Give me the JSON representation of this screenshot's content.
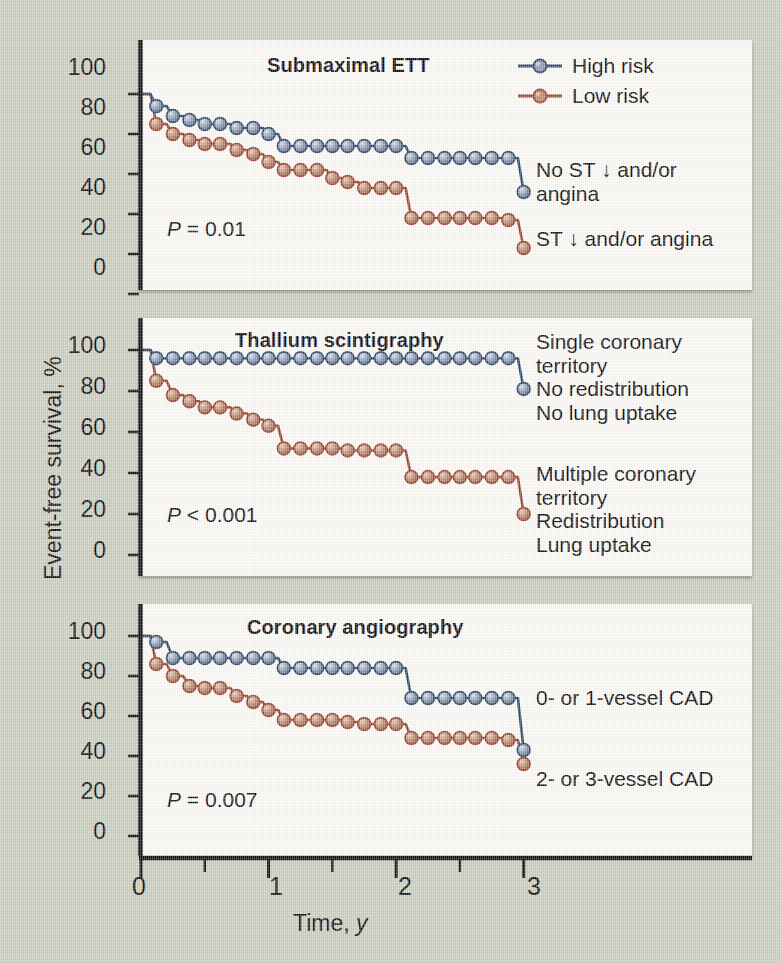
{
  "figure": {
    "background_color": "#ccd0bf",
    "panel_color": "#fdfcf7",
    "high_risk_color": "#2e4a6b",
    "low_risk_color": "#9c4430",
    "high_risk_marker_color": "#8c9cb4",
    "low_risk_marker_color": "#c08a6e",
    "x_axis_title_main": "Time, ",
    "x_axis_title_italic": "y",
    "y_axis_title": "Event-free survival, %",
    "x_tick_labels": [
      "0",
      "1",
      "2",
      "3"
    ],
    "y_tick_labels": [
      "0",
      "20",
      "40",
      "60",
      "80",
      "100"
    ]
  },
  "legend": {
    "items": [
      {
        "label": "High risk",
        "color": "#2e4a6b",
        "marker": "#8c9cb4"
      },
      {
        "label": "Low risk",
        "color": "#9c4430",
        "marker": "#c08a6e"
      }
    ]
  },
  "chart_data": [
    {
      "type": "line",
      "panel": "a",
      "title": "Submaximal ETT",
      "pvalue_prefix": "P",
      "pvalue_text": " = 0.01",
      "xlabel": "Time, y",
      "ylabel": "Event-free survival, %",
      "xlim": [
        0,
        3.12
      ],
      "ylim": [
        0,
        108
      ],
      "xticks": [
        0,
        1,
        2,
        3
      ],
      "yticks": [
        0,
        20,
        40,
        60,
        80,
        100
      ],
      "x_minor_ticks": [
        0.5,
        1.5,
        2.5
      ],
      "grid": false,
      "legend_position": "top-right",
      "label_high": "No ST ↓ and/or\nangina",
      "label_low": "ST ↓ and/or angina",
      "series": [
        {
          "name": "High risk",
          "color": "#2e4a6b",
          "marker_color": "#8c9cb4",
          "x": [
            0.0,
            0.12,
            0.25,
            0.38,
            0.5,
            0.62,
            0.75,
            0.88,
            1.0,
            1.12,
            1.25,
            1.38,
            1.5,
            1.62,
            1.75,
            1.88,
            2.0,
            2.12,
            2.25,
            2.38,
            2.5,
            2.62,
            2.75,
            2.88,
            3.0
          ],
          "y": [
            100,
            94,
            89,
            87,
            85,
            85,
            83,
            83,
            80,
            74,
            74,
            74,
            74,
            74,
            74,
            74,
            74,
            68,
            68,
            68,
            68,
            68,
            68,
            68,
            51
          ]
        },
        {
          "name": "Low risk",
          "color": "#9c4430",
          "marker_color": "#c08a6e",
          "x": [
            0.0,
            0.12,
            0.25,
            0.38,
            0.5,
            0.62,
            0.75,
            0.88,
            1.0,
            1.12,
            1.25,
            1.38,
            1.5,
            1.62,
            1.75,
            1.88,
            2.0,
            2.12,
            2.25,
            2.38,
            2.5,
            2.62,
            2.75,
            2.88,
            3.0
          ],
          "y": [
            100,
            85,
            80,
            77,
            75,
            75,
            72,
            70,
            66,
            62,
            62,
            62,
            58,
            56,
            53,
            53,
            53,
            38,
            38,
            38,
            38,
            38,
            38,
            37,
            23
          ]
        }
      ]
    },
    {
      "type": "line",
      "panel": "b",
      "title": "Thallium scintigraphy",
      "pvalue_prefix": "P",
      "pvalue_text": " < 0.001",
      "xlabel": "Time, y",
      "ylabel": "Event-free survival, %",
      "xlim": [
        0,
        3.12
      ],
      "ylim": [
        0,
        108
      ],
      "xticks": [
        0,
        1,
        2,
        3
      ],
      "yticks": [
        0,
        20,
        40,
        60,
        80,
        100
      ],
      "x_minor_ticks": [
        0.5,
        1.5,
        2.5
      ],
      "grid": false,
      "legend_position": "none",
      "label_high": "Single coronary\nterritory\n  No redistribution\n  No lung uptake",
      "label_low": "Multiple coronary\nterritory\n  Redistribution\n  Lung uptake",
      "series": [
        {
          "name": "High risk",
          "color": "#2e4a6b",
          "marker_color": "#8c9cb4",
          "x": [
            0.0,
            0.12,
            0.25,
            0.38,
            0.5,
            0.62,
            0.75,
            0.88,
            1.0,
            1.12,
            1.25,
            1.38,
            1.5,
            1.62,
            1.75,
            1.88,
            2.0,
            2.12,
            2.25,
            2.38,
            2.5,
            2.62,
            2.75,
            2.88,
            3.0
          ],
          "y": [
            100,
            96,
            96,
            96,
            96,
            96,
            96,
            96,
            96,
            96,
            96,
            96,
            96,
            96,
            96,
            96,
            96,
            96,
            96,
            96,
            96,
            96,
            96,
            96,
            81
          ]
        },
        {
          "name": "Low risk",
          "color": "#9c4430",
          "marker_color": "#c08a6e",
          "x": [
            0.0,
            0.12,
            0.25,
            0.38,
            0.5,
            0.62,
            0.75,
            0.88,
            1.0,
            1.12,
            1.25,
            1.38,
            1.5,
            1.62,
            1.75,
            1.88,
            2.0,
            2.12,
            2.25,
            2.38,
            2.5,
            2.62,
            2.75,
            2.88,
            3.0
          ],
          "y": [
            100,
            85,
            78,
            75,
            72,
            72,
            69,
            66,
            63,
            52,
            52,
            52,
            52,
            51,
            51,
            51,
            51,
            38,
            38,
            38,
            38,
            38,
            38,
            38,
            20
          ]
        }
      ]
    },
    {
      "type": "line",
      "panel": "c",
      "title": "Coronary angiography",
      "pvalue_prefix": "P",
      "pvalue_text": " = 0.007",
      "xlabel": "Time, y",
      "ylabel": "Event-free survival, %",
      "xlim": [
        0,
        3.12
      ],
      "ylim": [
        0,
        108
      ],
      "xticks": [
        0,
        1,
        2,
        3
      ],
      "yticks": [
        0,
        20,
        40,
        60,
        80,
        100
      ],
      "x_minor_ticks": [
        0.5,
        1.5,
        2.5
      ],
      "grid": false,
      "legend_position": "none",
      "label_high": "0- or 1-vessel CAD",
      "label_low": "2- or 3-vessel CAD",
      "series": [
        {
          "name": "High risk",
          "color": "#2e4a6b",
          "marker_color": "#8c9cb4",
          "x": [
            0.0,
            0.12,
            0.25,
            0.38,
            0.5,
            0.62,
            0.75,
            0.88,
            1.0,
            1.12,
            1.25,
            1.38,
            1.5,
            1.62,
            1.75,
            1.88,
            2.0,
            2.12,
            2.25,
            2.38,
            2.5,
            2.62,
            2.75,
            2.88,
            3.0
          ],
          "y": [
            100,
            97,
            89,
            89,
            89,
            89,
            89,
            89,
            89,
            84,
            84,
            84,
            84,
            84,
            84,
            84,
            84,
            69,
            69,
            69,
            69,
            69,
            69,
            69,
            43
          ]
        },
        {
          "name": "Low risk",
          "color": "#9c4430",
          "marker_color": "#c08a6e",
          "x": [
            0.0,
            0.12,
            0.25,
            0.38,
            0.5,
            0.62,
            0.75,
            0.88,
            1.0,
            1.12,
            1.25,
            1.38,
            1.5,
            1.62,
            1.75,
            1.88,
            2.0,
            2.12,
            2.25,
            2.38,
            2.5,
            2.62,
            2.75,
            2.88,
            3.0
          ],
          "y": [
            100,
            86,
            80,
            75,
            74,
            74,
            70,
            67,
            63,
            58,
            58,
            58,
            58,
            57,
            56,
            56,
            56,
            49,
            49,
            49,
            49,
            49,
            49,
            48,
            36
          ]
        }
      ]
    }
  ]
}
